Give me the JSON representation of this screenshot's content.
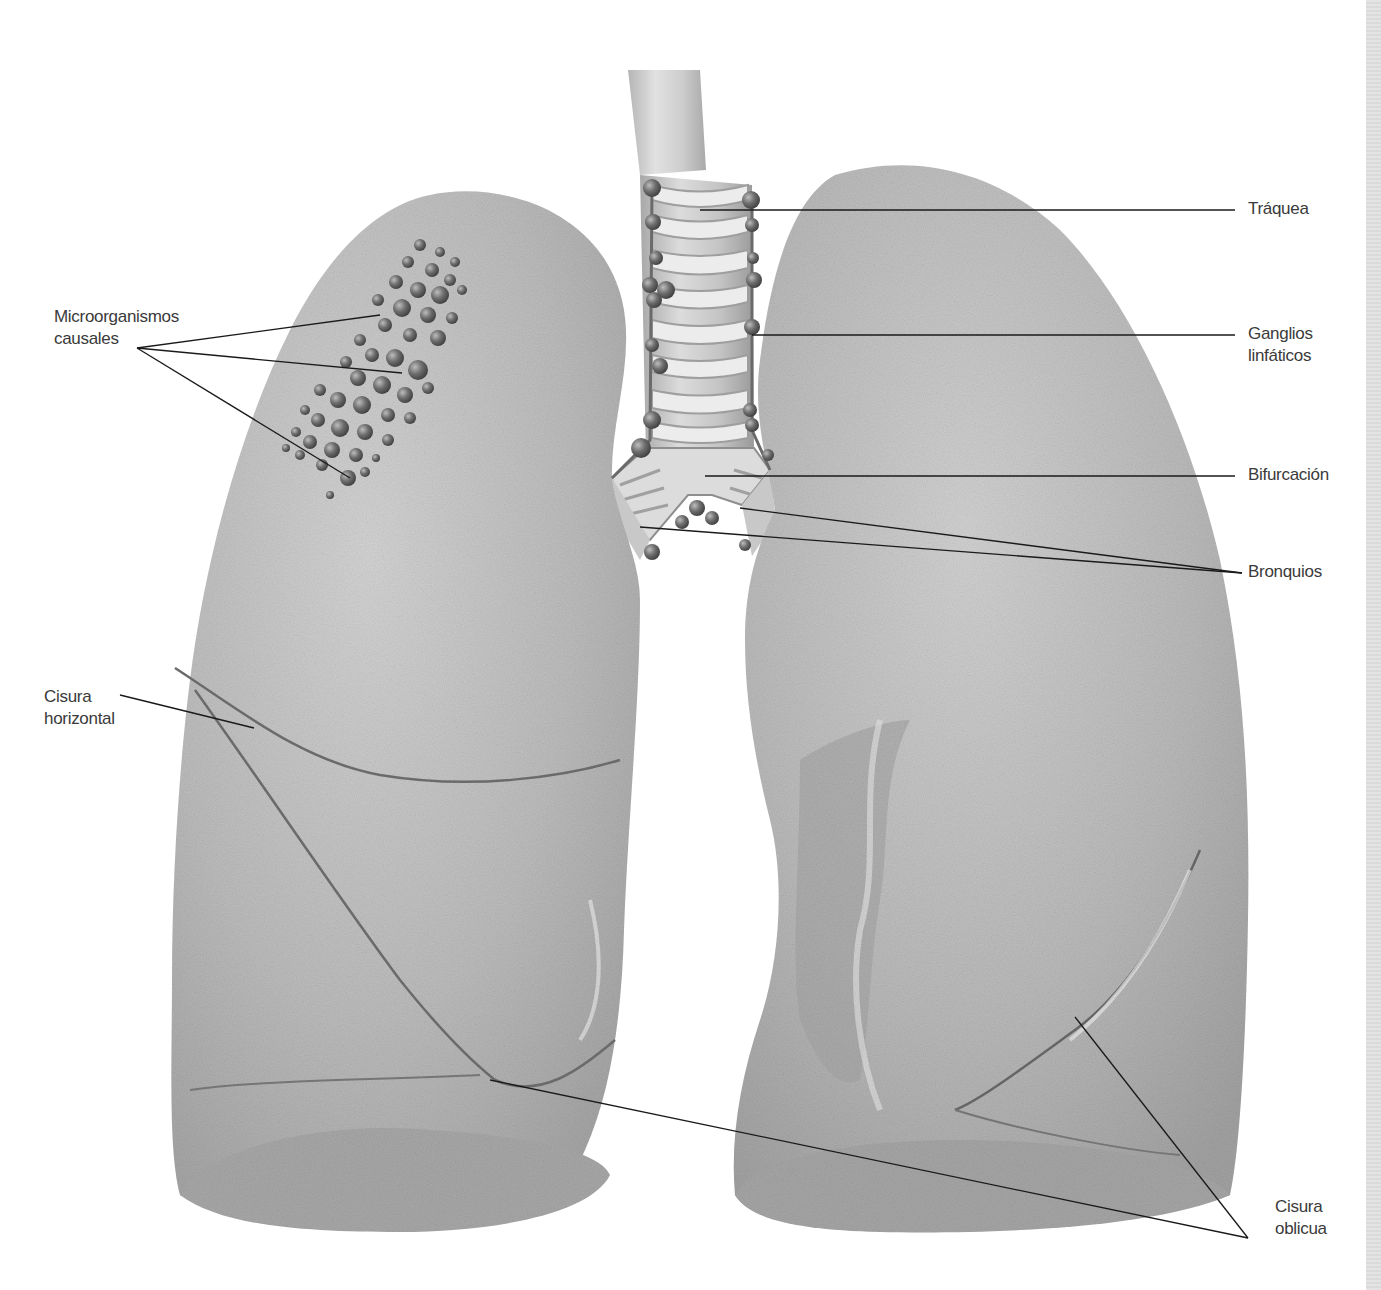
{
  "diagram": {
    "style": "grayscale anatomical illustration",
    "colors": {
      "background": "#ffffff",
      "lung_fill": "#bdbdbd",
      "lung_light": "#d6d6d6",
      "lung_shadow": "#9c9c9c",
      "trachea_ring": "#e8e8e8",
      "trachea_band": "#a9a9a9",
      "node": "#7a7a7a",
      "microorganism": "#5e5e5e",
      "leader_line": "#1a1a1a",
      "label_text": "#3a3a3a",
      "edge_strip": "#dddddd"
    },
    "labels": {
      "microorganismos": {
        "line1": "Microorganismos",
        "line2": "causales"
      },
      "cisura_horizontal": {
        "line1": "Cisura",
        "line2": "horizontal"
      },
      "traquea": {
        "line1": "Tráquea"
      },
      "ganglios": {
        "line1": "Ganglios",
        "line2": "linfáticos"
      },
      "bifurcacion": {
        "line1": "Bifurcación"
      },
      "bronquios": {
        "line1": "Bronquios"
      },
      "cisura_oblicua": {
        "line1": "Cisura",
        "line2": "oblicua"
      }
    }
  }
}
